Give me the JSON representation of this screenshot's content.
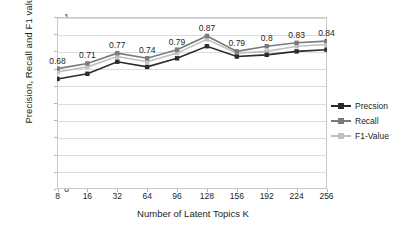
{
  "chart_data": {
    "type": "line",
    "title": "",
    "xlabel": "Number of Latent Topics K",
    "ylabel": "Precision, Recall and F1 values",
    "categories": [
      "8",
      "16",
      "32",
      "64",
      "96",
      "128",
      "156",
      "192",
      "224",
      "256"
    ],
    "ylim": [
      0,
      1
    ],
    "yticks": [
      "0",
      "0.1",
      "0.2",
      "0.3",
      "0.4",
      "0.5",
      "0.6",
      "0.7",
      "0.8",
      "0.9",
      "1"
    ],
    "grid": true,
    "legend_position": "right",
    "series": [
      {
        "name": "Precsion",
        "color": "#2b2b2b",
        "marker": "square",
        "values": [
          0.64,
          0.67,
          0.74,
          0.71,
          0.76,
          0.83,
          0.77,
          0.78,
          0.8,
          0.81
        ]
      },
      {
        "name": "Recall",
        "color": "#7a7a7a",
        "marker": "square",
        "values": [
          0.7,
          0.73,
          0.79,
          0.76,
          0.81,
          0.89,
          0.8,
          0.83,
          0.85,
          0.86
        ]
      },
      {
        "name": "F1-Value",
        "color": "#c0c0c0",
        "marker": "square",
        "values": [
          0.68,
          0.71,
          0.77,
          0.74,
          0.79,
          0.87,
          0.79,
          0.8,
          0.83,
          0.84
        ]
      }
    ],
    "data_labels": [
      "0.68",
      "0.71",
      "0.77",
      "0.74",
      "0.79",
      "0.87",
      "0.79",
      "0.8",
      "0.83",
      "0.84"
    ]
  }
}
